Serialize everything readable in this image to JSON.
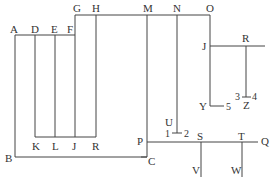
{
  "diagram": {
    "type": "line-network",
    "stroke_color": "#444444",
    "text_color": "#333333",
    "labels": {
      "A": "A",
      "B": "B",
      "C": "C",
      "D": "D",
      "E": "E",
      "F": "F",
      "G": "G",
      "H": "H",
      "M": "M",
      "N": "N",
      "O": "O",
      "J_top": "J",
      "R_top": "R",
      "K": "K",
      "L": "L",
      "J_bottom": "J",
      "R_bottom": "R",
      "P": "P",
      "Q": "Q",
      "S": "S",
      "T": "T",
      "U": "U",
      "V": "V",
      "W": "W",
      "Y": "Y",
      "Z": "Z",
      "n1": "1",
      "n2": "2",
      "n3": "3",
      "n4": "4",
      "n5": "5"
    }
  }
}
